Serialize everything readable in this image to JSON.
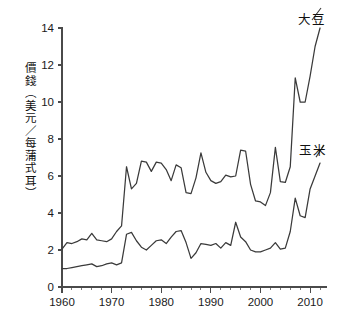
{
  "chart_data": {
    "type": "line",
    "title": "",
    "subtitle": "",
    "xlabel": "",
    "ylabel": "價錢（美元／每蒲式耳）",
    "xlim": [
      1960,
      2013
    ],
    "ylim": [
      0,
      14
    ],
    "ytick_labels": [
      "0",
      "2",
      "4",
      "6",
      "8",
      "10",
      "12",
      "14"
    ],
    "ytick_values": [
      0,
      2,
      4,
      6,
      8,
      10,
      12,
      14
    ],
    "xtick_labels": [
      "1960",
      "1970",
      "1980",
      "1990",
      "2000",
      "2010"
    ],
    "xtick_values": [
      1960,
      1970,
      1980,
      1990,
      2000,
      2010
    ],
    "x_minor_step": 2,
    "grid": false,
    "legend_position": "inline-right",
    "series": [
      {
        "name": "大豆",
        "color": "#3a3a3a",
        "x": [
          1960,
          1961,
          1962,
          1963,
          1964,
          1965,
          1966,
          1967,
          1968,
          1969,
          1970,
          1971,
          1972,
          1973,
          1974,
          1975,
          1976,
          1977,
          1978,
          1979,
          1980,
          1981,
          1982,
          1983,
          1984,
          1985,
          1986,
          1987,
          1988,
          1989,
          1990,
          1991,
          1992,
          1993,
          1994,
          1995,
          1996,
          1997,
          1998,
          1999,
          2000,
          2001,
          2002,
          2003,
          2004,
          2005,
          2006,
          2007,
          2008,
          2009,
          2010,
          2011,
          2012
        ],
        "values": [
          2.05,
          2.4,
          2.35,
          2.45,
          2.6,
          2.55,
          2.9,
          2.55,
          2.5,
          2.45,
          2.6,
          3.0,
          3.3,
          6.5,
          5.3,
          5.6,
          6.8,
          6.75,
          6.25,
          6.75,
          6.7,
          6.35,
          5.75,
          6.6,
          6.45,
          5.1,
          5.05,
          5.9,
          7.25,
          6.2,
          5.75,
          5.6,
          5.7,
          6.05,
          5.95,
          6.0,
          7.4,
          7.35,
          5.55,
          4.65,
          4.6,
          4.4,
          5.1,
          7.55,
          5.7,
          5.65,
          6.5,
          11.3,
          10.0,
          10.0,
          11.4,
          13.0,
          14.0
        ]
      },
      {
        "name": "玉米",
        "color": "#3a3a3a",
        "x": [
          1960,
          1961,
          1962,
          1963,
          1964,
          1965,
          1966,
          1967,
          1968,
          1969,
          1970,
          1971,
          1972,
          1973,
          1974,
          1975,
          1976,
          1977,
          1978,
          1979,
          1980,
          1981,
          1982,
          1983,
          1984,
          1985,
          1986,
          1987,
          1988,
          1989,
          1990,
          1991,
          1992,
          1993,
          1994,
          1995,
          1996,
          1997,
          1998,
          1999,
          2000,
          2001,
          2002,
          2003,
          2004,
          2005,
          2006,
          2007,
          2008,
          2009,
          2010,
          2011,
          2012
        ],
        "values": [
          1.0,
          1.0,
          1.05,
          1.1,
          1.15,
          1.2,
          1.25,
          1.1,
          1.15,
          1.25,
          1.3,
          1.2,
          1.3,
          2.85,
          2.95,
          2.5,
          2.15,
          2.0,
          2.25,
          2.5,
          2.55,
          2.35,
          2.7,
          3.0,
          3.05,
          2.4,
          1.55,
          1.85,
          2.35,
          2.3,
          2.25,
          2.35,
          2.1,
          2.4,
          2.25,
          3.5,
          2.7,
          2.45,
          2.0,
          1.9,
          1.9,
          2.0,
          2.1,
          2.4,
          2.05,
          2.1,
          3.0,
          4.8,
          3.85,
          3.75,
          5.3,
          6.0,
          6.7
        ]
      }
    ],
    "annotations": [
      {
        "text": "大豆",
        "target_x": 2012,
        "target_y": 13.5
      },
      {
        "text": "玉米",
        "target_x": 2012,
        "target_y": 6.4
      }
    ]
  },
  "axis": {
    "y_axis_name": "value-axis",
    "x_axis_name": "year-axis"
  }
}
